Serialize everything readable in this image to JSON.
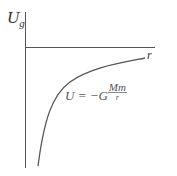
{
  "diagram": {
    "y_axis_label": "U",
    "y_axis_subscript": "g",
    "x_axis_label": "r",
    "formula": {
      "lhs": "U = −G",
      "numerator": "Mm",
      "denominator": "r"
    },
    "colors": {
      "axis": "#555555",
      "curve": "#555555",
      "text": "#333333"
    }
  }
}
